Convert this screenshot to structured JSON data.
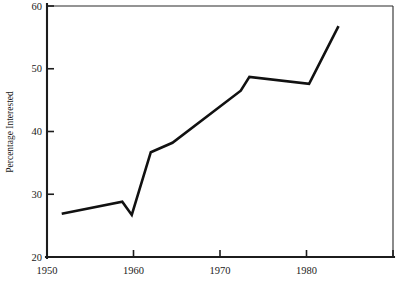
{
  "chart_data": {
    "type": "line",
    "title": "",
    "subtitle": "",
    "xlabel": "",
    "ylabel": "Percentage Interested",
    "xlim": [
      1950,
      1990
    ],
    "ylim": [
      20,
      60
    ],
    "grid": false,
    "legend": null,
    "x_ticks": [
      1950,
      1960,
      1970,
      1980,
      1990
    ],
    "x_tick_labels": [
      "1950",
      "1960",
      "1970",
      "1980",
      ""
    ],
    "y_ticks": [
      20,
      30,
      40,
      50,
      60
    ],
    "y_tick_labels": [
      "20",
      "30",
      "40",
      "50",
      "60"
    ],
    "series": [
      {
        "name": "Percentage Interested",
        "color": "#111111",
        "x": [
          1951.7,
          1958.7,
          1959.8,
          1962.0,
          1964.5,
          1972.4,
          1973.4,
          1980.3,
          1983.7
        ],
        "values": [
          26.9,
          28.8,
          26.7,
          36.7,
          38.2,
          46.5,
          48.7,
          47.6,
          56.8
        ]
      }
    ]
  },
  "labels": {
    "y_axis_title": "Percentage Interested"
  }
}
